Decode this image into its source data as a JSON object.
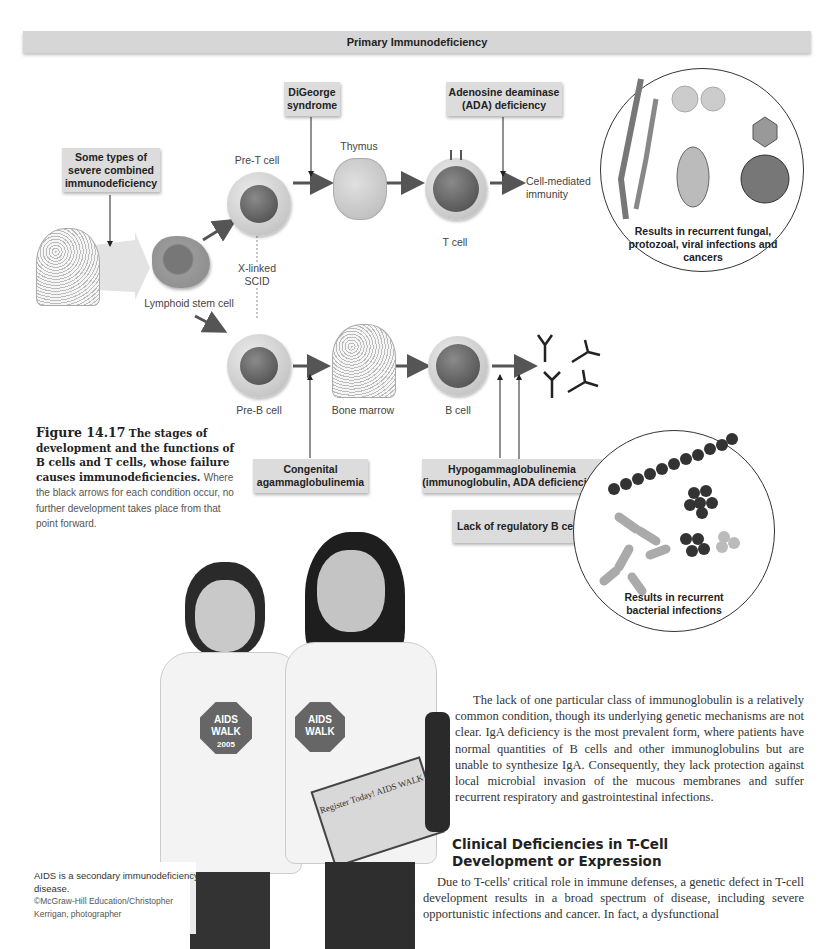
{
  "diagram": {
    "banner_title": "Primary Immunodeficiency",
    "conditions": {
      "scid": "Some types of severe combined immunodeficiency",
      "digeorge": "DiGeorge syndrome",
      "ada": "Adenosine deaminase (ADA) deficiency",
      "congenital_agamma": "Congenital agammaglobulinemia",
      "hypogamma_line1": "Hypogammaglobulinemia",
      "hypogamma_line2": "(immunoglobulin, ADA deficiencies)",
      "lack_regulatory": "Lack of regulatory B cells",
      "xlinked_line1": "X-linked",
      "xlinked_line2": "SCID"
    },
    "stage_labels": {
      "lymphoid_stem_cell": "Lymphoid stem cell",
      "pre_t_cell": "Pre-T cell",
      "thymus": "Thymus",
      "t_cell": "T cell",
      "cell_mediated_line1": "Cell-mediated",
      "cell_mediated_line2": "immunity",
      "pre_b_cell": "Pre-B cell",
      "bone_marrow": "Bone marrow",
      "b_cell": "B cell"
    },
    "panels": {
      "t_results": "Results in recurrent fungal, protozoal, viral infections and cancers",
      "b_results": "Results in recurrent bacterial infections"
    }
  },
  "figure_caption": {
    "number": "Figure 14.17",
    "bold_text": "The stages of development and the functions of B cells and T cells, whose failure causes immunodeficiencies.",
    "rest_text": "Where the black arrows for each condition occur, no further development takes place from that point forward."
  },
  "photo": {
    "alt": "Two volunteers wearing AIDS Walk San Francisco 2005 shirts",
    "caption": "AIDS is a secondary immunodeficiency disease.",
    "credit": "©McGraw-Hill Education/Christopher Kerrigan, photographer",
    "shirt_text": "AIDS WALK",
    "shirt_year": "2005",
    "clipboard_text": "Register Today! AIDS WALK"
  },
  "body": {
    "paragraph1": "The lack of one particular class of immunoglobulin is a relatively common condition, though its underlying genetic mechanisms are not clear. IgA deficiency is the most prevalent form, where patients have normal quantities of B cells and other immunoglobulins but are unable to synthesize IgA. Consequently, they lack protection against local microbial invasion of the mucous membranes and suffer recurrent respiratory and gastrointestinal infections.",
    "section_heading_line1": "Clinical Deficiencies in T-Cell",
    "section_heading_line2": "Development or Expression",
    "paragraph2": "Due to T-cells' critical role in immune defenses, a genetic defect in T-cell development results in a broad spectrum of disease, including severe opportunistic infections and cancer. In fact, a dysfunctional"
  }
}
